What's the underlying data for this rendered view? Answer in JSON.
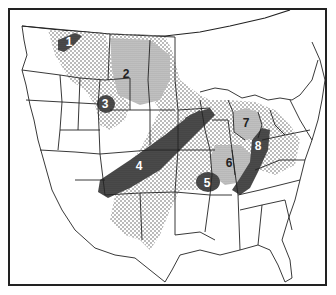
{
  "map": {
    "title": "",
    "region": "Contiguous United States (northern portion with southern Canada)",
    "colors": {
      "background": "#ffffff",
      "border": "#222222",
      "light_stipple": "#9a9a9a",
      "medium_shade": "#b8b8b8",
      "dark_shade": "#4a4a4a",
      "label_on_dark": "#ffffff",
      "label_on_light": "#222222"
    },
    "legend": [],
    "zones": [
      {
        "id": "1",
        "label": "1",
        "shade": "dark",
        "location": "northern Montana / Canada border"
      },
      {
        "id": "2",
        "label": "2",
        "shade": "medium",
        "location": "North Dakota / Saskatchewan"
      },
      {
        "id": "3",
        "label": "3",
        "shade": "dark",
        "location": "southwest North Dakota / eastern Montana"
      },
      {
        "id": "4",
        "label": "4",
        "shade": "dark",
        "location": "band from Colorado/New Mexico to Iowa/Minnesota"
      },
      {
        "id": "5",
        "label": "5",
        "shade": "dark",
        "location": "Missouri / Arkansas"
      },
      {
        "id": "6",
        "label": "6",
        "shade": "medium",
        "location": "Illinois / Indiana"
      },
      {
        "id": "7",
        "label": "7",
        "shade": "medium",
        "location": "Michigan"
      },
      {
        "id": "8",
        "label": "8",
        "shade": "dark",
        "location": "Ohio / Kentucky band"
      }
    ]
  }
}
